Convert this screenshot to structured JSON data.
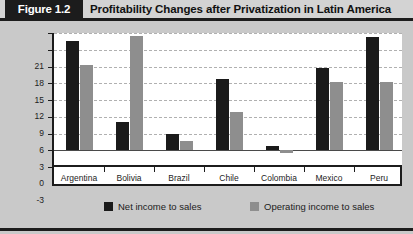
{
  "header": {
    "figure_label": "Figure 1.2",
    "title": "Profitability Changes after Privatization in Latin America"
  },
  "axes": {
    "ylabel": "Percentage Points",
    "yticks": [
      21,
      18,
      15,
      12,
      9,
      6,
      3,
      0,
      -3
    ],
    "ytick_labels": [
      "21",
      "18",
      "15",
      "12",
      "9",
      "6",
      "3",
      "0",
      "-3"
    ],
    "ymin": -3,
    "ymax": 21
  },
  "legend": {
    "items": [
      {
        "label": "Net income to sales",
        "color": "#1a1a1a",
        "key": "net_income"
      },
      {
        "label": "Operating income to sales",
        "color": "#8e8e8e",
        "key": "operating_income"
      }
    ]
  },
  "chart_data": {
    "type": "bar",
    "title": "Profitability Changes after Privatization in Latin America",
    "xlabel": "",
    "ylabel": "Percentage Points",
    "ylim": [
      -3,
      21
    ],
    "ytick_step": 3,
    "grid": true,
    "legend_position": "bottom",
    "categories": [
      "Argentina",
      "Bolivia",
      "Brazil",
      "Chile",
      "Colombia",
      "Mexico",
      "Peru"
    ],
    "series": [
      {
        "name": "Net income to sales",
        "color": "#1a1a1a",
        "values": [
          19.5,
          5.0,
          3.0,
          12.7,
          0.8,
          14.7,
          20.3
        ]
      },
      {
        "name": "Operating income to sales",
        "color": "#8e8e8e",
        "values": [
          15.3,
          20.4,
          1.7,
          6.8,
          -0.5,
          12.2,
          12.2
        ]
      }
    ]
  }
}
